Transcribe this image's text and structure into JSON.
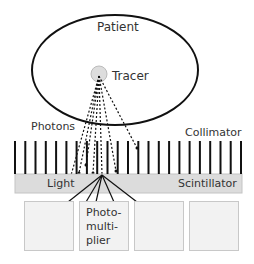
{
  "diagram": {
    "type": "gamma-camera schematic",
    "labels": {
      "patient": "Patient",
      "tracer": "Tracer",
      "photons": "Photons",
      "collimator": "Collimator",
      "light": "Light",
      "scintillator": "Scintillator",
      "photomultiplier": "Photo-\nmulti-\nplier"
    },
    "colors": {
      "outline": "#111111",
      "tracer_fill": "#dddddd",
      "scintillator_fill": "#dcdcdc",
      "pmt_fill": "#f2f2f2",
      "pmt_border": "#c8c8c8",
      "text": "#333333"
    },
    "collimator_bar_count": 23,
    "photomultiplier_count": 4
  }
}
